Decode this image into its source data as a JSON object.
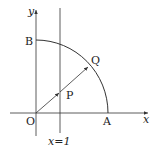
{
  "diagram": {
    "type": "coordinate-geometry",
    "axes": {
      "x_label": "x",
      "y_label": "y",
      "origin_label": "O"
    },
    "points": {
      "A": {
        "label": "A"
      },
      "B": {
        "label": "B"
      },
      "P": {
        "label": "P"
      },
      "Q": {
        "label": "Q"
      }
    },
    "vertical_line": {
      "label": "x=1"
    },
    "arc": {
      "description": "quarter circle centered at O from A to B"
    },
    "colors": {
      "stroke": "#333333",
      "text": "#222222",
      "background": "#ffffff"
    }
  }
}
